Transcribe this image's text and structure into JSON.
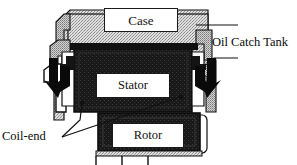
{
  "figure": {
    "type": "technical-cross-section-diagram",
    "background_color": "#ffffff",
    "line_color": "#111111",
    "fill_dark": "#1a1a1a",
    "fill_stipple": "#c9c9c9"
  },
  "callouts": {
    "oil_catch_tank": "Oil Catch Tank",
    "coil_end": "Coil-end"
  },
  "parts": {
    "case": "Case",
    "stator": "Stator",
    "rotor": "Rotor"
  },
  "arrows": {
    "left_flow": "downward-oil-flow-arrow-left",
    "right_flow": "downward-oil-flow-arrow-right"
  }
}
